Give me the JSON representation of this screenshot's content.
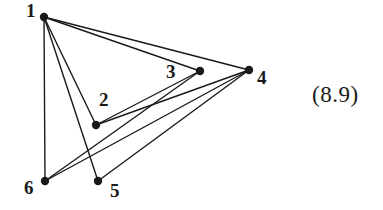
{
  "figure": {
    "type": "undirected-graph-diagram",
    "equation_tag": "(8.9)",
    "ink_color": "#1a1a1a",
    "background_color": "#ffffff",
    "vertices": [
      {
        "id": "1",
        "label": "1",
        "cx": 44,
        "cy": 17,
        "label_x": 26,
        "label_y": 1
      },
      {
        "id": "2",
        "label": "2",
        "cx": 96,
        "cy": 125,
        "label_x": 99,
        "label_y": 90
      },
      {
        "id": "3",
        "label": "3",
        "cx": 200,
        "cy": 71,
        "label_x": 166,
        "label_y": 62
      },
      {
        "id": "4",
        "label": "4",
        "cx": 249,
        "cy": 70,
        "label_x": 257,
        "label_y": 68
      },
      {
        "id": "5",
        "label": "5",
        "cx": 98,
        "cy": 181,
        "label_x": 110,
        "label_y": 181
      },
      {
        "id": "6",
        "label": "6",
        "cx": 45,
        "cy": 181,
        "label_x": 24,
        "label_y": 178
      }
    ],
    "edges": [
      {
        "from": "1",
        "to": "3"
      },
      {
        "from": "1",
        "to": "4"
      },
      {
        "from": "1",
        "to": "2"
      },
      {
        "from": "1",
        "to": "5"
      },
      {
        "from": "1",
        "to": "6"
      },
      {
        "from": "2",
        "to": "3"
      },
      {
        "from": "2",
        "to": "4"
      },
      {
        "from": "6",
        "to": "4"
      },
      {
        "from": "6",
        "to": "3"
      },
      {
        "from": "5",
        "to": "4"
      }
    ],
    "vertex_radius": 4.2,
    "edge_width": 1.4
  }
}
